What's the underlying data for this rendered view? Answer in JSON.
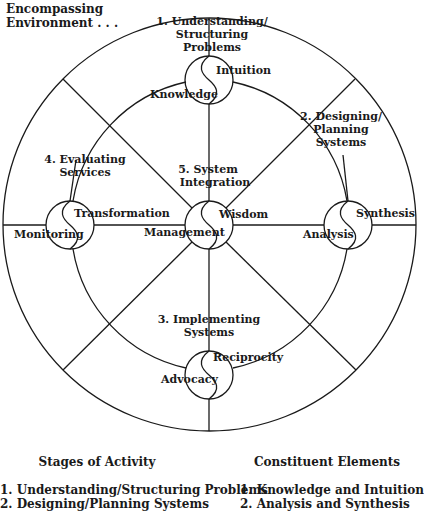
{
  "diagram": {
    "corner_label": [
      "Encompassing",
      "Environment . . ."
    ],
    "stages": [
      {
        "id": 1,
        "label_lines": [
          "1. Understanding/",
          "Structuring",
          "Problems"
        ],
        "elements": [
          "Knowledge",
          "Intuition"
        ],
        "position": "top"
      },
      {
        "id": 2,
        "label_lines": [
          "2. Designing/",
          "Planning",
          "Systems"
        ],
        "elements": [
          "Analysis",
          "Synthesis"
        ],
        "position": "right"
      },
      {
        "id": 3,
        "label_lines": [
          "3. Implementing",
          "Systems"
        ],
        "elements": [
          "Advocacy",
          "Reciprocity"
        ],
        "position": "bottom"
      },
      {
        "id": 4,
        "label_lines": [
          "4. Evaluating",
          "Services"
        ],
        "elements": [
          "Monitoring",
          "Transformation"
        ],
        "position": "left"
      },
      {
        "id": 5,
        "label_lines": [
          "5. System",
          "Integration"
        ],
        "elements": [
          "Management",
          "Wisdom"
        ],
        "position": "center"
      }
    ],
    "colors": {
      "line": "#1a1a1a",
      "text": "#1a1a1a",
      "background": "#ffffff"
    }
  },
  "legend": {
    "stages_title": "Stages of Activity",
    "stages_items": [
      "1. Understanding/Structuring Problems",
      "2. Designing/Planning Systems"
    ],
    "elements_title": "Constituent Elements",
    "elements_items": [
      "1. Knowledge and Intuition",
      "2. Analysis and Synthesis"
    ]
  }
}
